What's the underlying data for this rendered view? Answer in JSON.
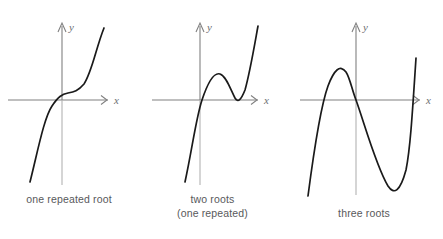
{
  "figure": {
    "width": 443,
    "height": 239,
    "background": "#ffffff",
    "curve_color": "#1a1a1a",
    "axis_color": "#808080",
    "axis_color_light": "#b3b3b3",
    "caption_color": "#58595b"
  },
  "axis_labels": {
    "x": "x",
    "y": "y"
  },
  "panels": [
    {
      "id": "panel-one-repeated-root",
      "caption": "one repeated root",
      "caption_line2": "",
      "roots_count": 1,
      "root_description": "one repeated root",
      "origin": {
        "x": 62,
        "y": 100
      },
      "x_axis": {
        "y": 100,
        "x_start": 8,
        "x_end": 112
      },
      "y_axis": {
        "x": 62,
        "y_top": 22,
        "y_bottom": 185
      },
      "curve_path": "M 30,182 C 38,150 44,118 52,106 C 58,97 62,94 68,93 C 74,92 78,91 84,84 C 92,72 96,48 104,28"
    },
    {
      "id": "panel-two-roots-one-repeated",
      "caption": "two roots",
      "caption_line2": "(one repeated)",
      "roots_count": 2,
      "root_description": "two roots (one repeated)",
      "origin": {
        "x": 200,
        "y": 100
      },
      "x_axis": {
        "y": 100,
        "x_start": 152,
        "x_end": 262
      },
      "y_axis": {
        "x": 200,
        "y_top": 22,
        "y_bottom": 185
      },
      "curve_path": "M 185,182 C 192,150 196,118 202,100 C 208,82 214,72 220,74 C 226,76 230,88 235,98 C 238,103 241,100 245,90 C 250,72 254,48 258,26"
    },
    {
      "id": "panel-three-roots",
      "caption": "three roots",
      "caption_line2": "",
      "roots_count": 3,
      "root_description": "three roots",
      "origin": {
        "x": 356,
        "y": 100
      },
      "x_axis": {
        "y": 100,
        "x_start": 300,
        "x_end": 424
      },
      "y_axis": {
        "x": 356,
        "y_top": 22,
        "y_bottom": 195
      },
      "curve_path": "M 308,196 C 314,150 320,108 328,86 C 334,70 340,64 346,72 C 350,78 352,90 356,100 C 364,122 376,166 388,186 C 394,195 400,192 406,170 C 410,150 412,120 416,58"
    }
  ],
  "caption_positions": [
    {
      "left": 0,
      "top": 192,
      "width": 138
    },
    {
      "left": 145,
      "top": 192,
      "width": 118
    },
    {
      "left": 300,
      "top": 206,
      "width": 128
    }
  ]
}
